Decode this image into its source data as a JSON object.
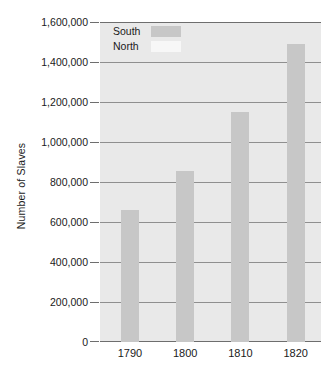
{
  "chart_data": {
    "type": "bar",
    "title": "",
    "subtitle": "",
    "xlabel": "",
    "ylabel": "Number of Slaves",
    "categories": [
      "1790",
      "1800",
      "1810",
      "1820"
    ],
    "series": [
      {
        "name": "South",
        "color": "#c7c7c7",
        "values": [
          660000,
          855000,
          1150000,
          1490000
        ]
      },
      {
        "name": "North",
        "color": "#f7f7f7",
        "values": [
          0,
          0,
          0,
          0
        ]
      }
    ],
    "ylim": [
      0,
      1600000
    ],
    "ytick_values": [
      0,
      200000,
      400000,
      600000,
      800000,
      1000000,
      1200000,
      1400000,
      1600000
    ],
    "ytick_labels": [
      "0",
      "200,000",
      "400,000",
      "600,000",
      "800,000",
      "1,000,000",
      "1,200,000",
      "1,400,000",
      "1,600,000"
    ],
    "grid": true,
    "legend_position": "top-left",
    "plot_background": "#e9e9e9",
    "annotations": []
  },
  "legend": {
    "entries": [
      {
        "label": "South",
        "swatch_color": "#c7c7c7"
      },
      {
        "label": "North",
        "swatch_color": "#f7f7f7"
      }
    ]
  },
  "axes": {
    "y_title": "Number of Slaves",
    "y_labels": [
      "1,600,000",
      "1,400,000",
      "1,200,000",
      "1,000,000",
      "800,000",
      "600,000",
      "400,000",
      "200,000",
      "0"
    ],
    "x_labels": [
      "1790",
      "1800",
      "1810",
      "1820"
    ]
  }
}
